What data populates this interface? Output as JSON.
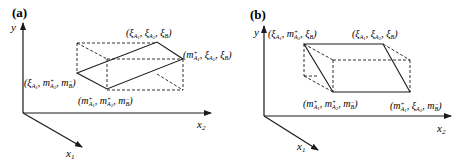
{
  "figure": {
    "panels": [
      {
        "id": "a",
        "label": "(a)",
        "axes": {
          "y": "y",
          "x1": "x1",
          "x2": "x2"
        },
        "points": [
          {
            "name": "top",
            "label": "(ξA1, ξA2, ξB)"
          },
          {
            "name": "right",
            "label": "(m+A1, ξA2, ξB)"
          },
          {
            "name": "left",
            "label": "(ξA1, m+A2, m−B)"
          },
          {
            "name": "bottom",
            "label": "(m+A1, m+A2, m−B)"
          }
        ]
      },
      {
        "id": "b",
        "label": "(b)",
        "axes": {
          "y": "y",
          "x1": "x1",
          "x2": "x2"
        },
        "points": [
          {
            "name": "top-left",
            "label": "(ξA1, m+A2, ξB)"
          },
          {
            "name": "top-right",
            "label": "(ξA1, ξA2, ξB)"
          },
          {
            "name": "bottom-left",
            "label": "(m+A1, m+A2, m−B)"
          },
          {
            "name": "bottom-right",
            "label": "(m+A1, ξA2, m−B)"
          }
        ]
      }
    ]
  }
}
